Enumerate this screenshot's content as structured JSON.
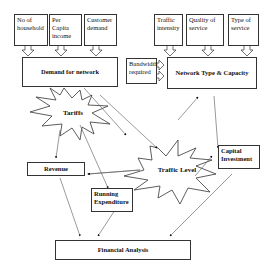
{
  "diagram": {
    "inputs_left": [
      {
        "id": "households",
        "label": "No of household"
      },
      {
        "id": "per_capita",
        "label": "Per Capita income"
      },
      {
        "id": "customer_demand",
        "label": "Customer demand"
      }
    ],
    "inputs_right": [
      {
        "id": "traffic_intensity",
        "label": "Traffic intensity"
      },
      {
        "id": "quality",
        "label": "Quality of service"
      },
      {
        "id": "type",
        "label": "Type of service"
      }
    ],
    "bandwidth": {
      "label": "Bandwidth required"
    },
    "demand": {
      "label": "Demand for network"
    },
    "network": {
      "label": "Network Type & Capacity"
    },
    "tariffs": {
      "label": "Tariffs"
    },
    "traffic_level": {
      "label": "Traffic Level"
    },
    "revenue": {
      "label": "Revenue"
    },
    "running": {
      "label": "Running Expenditure"
    },
    "capital": {
      "label": "Capital Investment"
    },
    "financial": {
      "label": "Financial Analysis"
    }
  }
}
